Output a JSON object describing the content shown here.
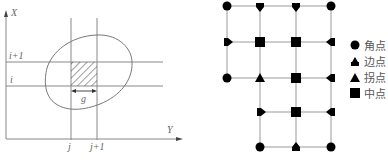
{
  "left_diagram": {
    "axis_labels": {
      "vertical": "X",
      "horizontal": "Y"
    },
    "row_labels": [
      "i+1",
      "i"
    ],
    "column_labels": [
      "j",
      "j+1"
    ],
    "cell_width_label": "g"
  },
  "right_diagram": {
    "legend": [
      {
        "symbol": "circle",
        "label": "角点"
      },
      {
        "symbol": "edge-triangle",
        "label": "边点"
      },
      {
        "symbol": "triangle",
        "label": "拐点"
      },
      {
        "symbol": "square",
        "label": "中点"
      }
    ]
  },
  "colors": {
    "line": "#8a8a8a",
    "marker": "#000000",
    "text": "#666666"
  }
}
